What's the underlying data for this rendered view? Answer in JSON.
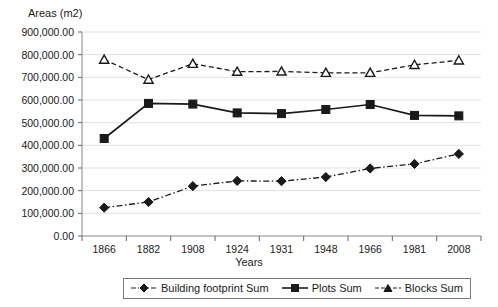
{
  "chart_data": {
    "type": "line",
    "title": "",
    "ylabel": "Areas (m2)",
    "xlabel": "Years",
    "categories": [
      "1866",
      "1882",
      "1908",
      "1924",
      "1931",
      "1948",
      "1966",
      "1981",
      "2008"
    ],
    "ylim": [
      0,
      900000
    ],
    "ytick_labels": [
      "900,000.00",
      "800,000.00",
      "700,000.00",
      "600,000.00",
      "500,000.00",
      "400,000.00",
      "300,000.00",
      "200,000.00",
      "100,000.00",
      "0.00"
    ],
    "ytick_values": [
      900000,
      800000,
      700000,
      600000,
      500000,
      400000,
      300000,
      200000,
      100000,
      0
    ],
    "grid": true,
    "legend_position": "bottom",
    "series": [
      {
        "name": "Building footprint Sum",
        "marker": "diamond",
        "line_style": "dash-dot",
        "color": "#1a1a1a",
        "values": [
          125000,
          150000,
          220000,
          243000,
          242000,
          260000,
          298000,
          318000,
          362000
        ]
      },
      {
        "name": "Plots Sum",
        "marker": "square",
        "line_style": "solid",
        "color": "#1a1a1a",
        "values": [
          430000,
          585000,
          582000,
          543000,
          540000,
          558000,
          580000,
          532000,
          530000
        ]
      },
      {
        "name": "Blocks Sum",
        "marker": "triangle",
        "line_style": "dashed",
        "color": "#1a1a1a",
        "values": [
          778000,
          690000,
          760000,
          725000,
          726000,
          720000,
          720000,
          755000,
          775000
        ]
      }
    ]
  },
  "legend": {
    "items": [
      {
        "label": "Building footprint Sum"
      },
      {
        "label": "Plots Sum"
      },
      {
        "label": "Blocks Sum"
      }
    ]
  }
}
